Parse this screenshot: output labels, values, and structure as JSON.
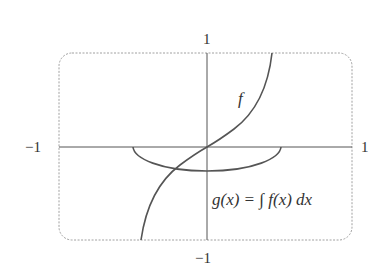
{
  "diagram": {
    "title": "",
    "axes": {
      "x_min_label": "−1",
      "x_max_label": "1",
      "y_max_label": "1",
      "y_min_label": "−1",
      "xlim": [
        -1,
        1
      ],
      "ylim": [
        -1,
        1
      ]
    },
    "frame": {
      "style": "dashed rounded rectangle",
      "color": "#9a9a9a"
    },
    "curves": [
      {
        "name": "f",
        "label": "f",
        "description": "increasing odd function through origin, vertical asymptote-like near x = ±0.45",
        "color": "#555555"
      },
      {
        "name": "g",
        "label": "g(x) = ∫ f(x) dx",
        "description": "bowl-shaped curve below x-axis from x ≈ −0.51 to 0.51, minimum ≈ −0.26 at x = 0",
        "color": "#555555"
      }
    ],
    "axis_color": "#555555"
  }
}
